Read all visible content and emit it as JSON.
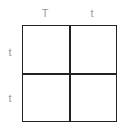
{
  "diagram": {
    "type": "punnett-square",
    "columns": [
      "T",
      "t"
    ],
    "rows": [
      "t",
      "t"
    ],
    "cells": [
      [
        "",
        ""
      ],
      [
        "",
        ""
      ]
    ]
  }
}
